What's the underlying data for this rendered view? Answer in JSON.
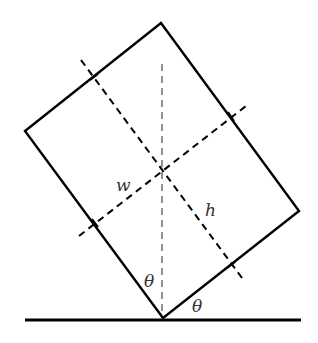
{
  "diagram": {
    "colors": {
      "background": "#ffffff",
      "stroke": "#000000",
      "vertical_dash": "#777777",
      "label": "#333333"
    },
    "rectangle": {
      "corners": {
        "top": [
          161,
          23
        ],
        "right": [
          299,
          211
        ],
        "bottom": [
          163,
          318
        ],
        "left": [
          25,
          131
        ]
      },
      "center": [
        162,
        170
      ]
    },
    "ground_line": {
      "x1": 25,
      "y1": 320,
      "x2": 301,
      "y2": 320
    },
    "axes": {
      "h_axis": {
        "x1": 81,
        "y1": 60,
        "x2": 245,
        "y2": 282
      },
      "w_axis": {
        "x1": 79,
        "y1": 236,
        "x2": 246,
        "y2": 106
      },
      "vertical": {
        "x1": 162,
        "y1": 64,
        "x2": 162,
        "y2": 318
      }
    },
    "labels": {
      "width": "w",
      "height": "h",
      "angle_left": "θ",
      "angle_right": "θ"
    }
  }
}
